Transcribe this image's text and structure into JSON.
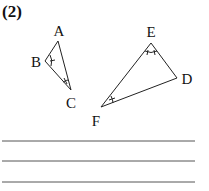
{
  "problem_number": "(2)",
  "triangle_1": {
    "vertices": {
      "A": [
        58,
        41
      ],
      "B": [
        45,
        61
      ],
      "C": [
        71,
        90
      ]
    },
    "labels": {
      "A": "A",
      "B": "B",
      "C": "C"
    },
    "label_pos": {
      "A": [
        59,
        31
      ],
      "B": [
        36,
        62
      ],
      "C": [
        71,
        103
      ]
    },
    "angle_marks": {
      "B": "single arc",
      "C": "double tick"
    }
  },
  "triangle_2": {
    "vertices": {
      "E": [
        151,
        43
      ],
      "D": [
        177,
        78
      ],
      "F": [
        101,
        107
      ]
    },
    "labels": {
      "E": "E",
      "D": "D",
      "F": "F"
    },
    "label_pos": {
      "E": [
        151,
        32
      ],
      "D": [
        187,
        79
      ],
      "F": [
        96,
        121
      ]
    },
    "angle_marks": {
      "E": "double tick",
      "F": "single arc"
    }
  },
  "answer_lines": 3,
  "line_color": "#555555"
}
